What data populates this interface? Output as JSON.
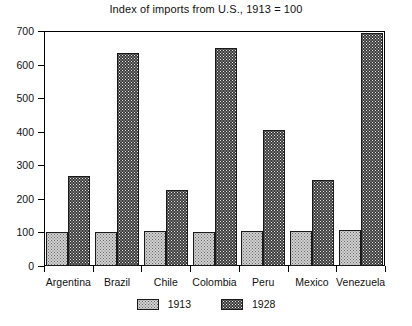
{
  "chart_data": {
    "type": "bar",
    "title": "Index of imports from U.S., 1913 = 100",
    "xlabel": "",
    "ylabel": "",
    "ylim": [
      0,
      700
    ],
    "yticks": [
      0,
      100,
      200,
      300,
      400,
      500,
      600,
      700
    ],
    "ytick_labels": [
      "0",
      "100",
      "200",
      "300",
      "400",
      "500",
      "600",
      "700"
    ],
    "grid": false,
    "legend_position": "bottom-center",
    "categories": [
      "Argentina",
      "Brazil",
      "Chile",
      "Colombia",
      "Peru",
      "Mexico",
      "Venezuela"
    ],
    "series": [
      {
        "name": "1913",
        "fill": "light-dotted",
        "color": "#d0d0d0",
        "values": [
          100,
          100,
          103,
          102,
          103,
          105,
          108
        ]
      },
      {
        "name": "1928",
        "fill": "dark-dotted",
        "color": "#3a3a3a",
        "values": [
          268,
          634,
          226,
          649,
          405,
          256,
          694
        ]
      }
    ]
  },
  "legend": {
    "items": [
      {
        "label": "1913"
      },
      {
        "label": "1928"
      }
    ]
  },
  "colors": {
    "axis": "#000000",
    "text": "#111111",
    "series_1913": "#d0d0d0",
    "series_1928": "#3a3a3a",
    "background": "#ffffff"
  }
}
